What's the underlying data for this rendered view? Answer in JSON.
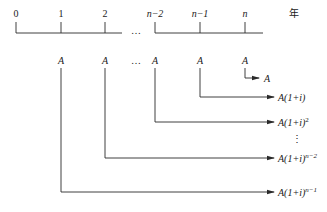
{
  "diagram": {
    "type": "cash-flow timeline (annuity future value)",
    "timeline": {
      "unit_label": "年",
      "ticks": [
        {
          "label": "0",
          "italic": false
        },
        {
          "label": "1",
          "italic": false
        },
        {
          "label": "2",
          "italic": false
        },
        {
          "label": "n−2",
          "italic": true
        },
        {
          "label": "n−1",
          "italic": true
        },
        {
          "label": "n",
          "italic": true
        }
      ],
      "gap_ellipsis": "…"
    },
    "payments": {
      "label": "A",
      "ellipsis": "…",
      "periods": [
        "1",
        "2",
        "n−2",
        "n−1",
        "n"
      ]
    },
    "future_values": [
      {
        "from_period": "n",
        "base": "A",
        "exponent": ""
      },
      {
        "from_period": "n−1",
        "base": "A(1+i)",
        "exponent": ""
      },
      {
        "from_period": "n−2",
        "base": "A(1+i)",
        "exponent": "2"
      },
      {
        "ellipsis": "⋮"
      },
      {
        "from_period": "2",
        "base": "A(1+i)",
        "exponent": "n−2"
      },
      {
        "from_period": "1",
        "base": "A(1+i)",
        "exponent": "n−1"
      }
    ],
    "colors": {
      "line": "#2a2a2a",
      "text": "#1a1a1a",
      "background": "#ffffff"
    }
  }
}
